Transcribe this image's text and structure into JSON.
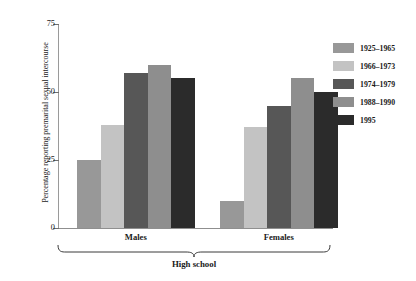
{
  "chart_data": {
    "type": "bar",
    "title": "",
    "xlabel": "High school",
    "ylabel": "Percentage reporting premarital sexual intercourse",
    "categories": [
      "Males",
      "Females"
    ],
    "series": [
      {
        "name": "1925–1965",
        "color": "#989898",
        "values": [
          25,
          10
        ]
      },
      {
        "name": "1966–1973",
        "color": "#c3c3c3",
        "values": [
          38,
          37
        ]
      },
      {
        "name": "1974–1979",
        "color": "#575757",
        "values": [
          57,
          45
        ]
      },
      {
        "name": "1988–1990",
        "color": "#8e8e8e",
        "values": [
          60,
          55
        ]
      },
      {
        "name": "1995",
        "color": "#2b2b2b",
        "values": [
          55,
          50
        ]
      }
    ],
    "ylim": [
      0,
      75
    ],
    "yticks": [
      0,
      25,
      50,
      75
    ],
    "ytick_labels": [
      "0",
      "25",
      "50",
      "75"
    ],
    "grid": false,
    "legend_position": "right",
    "group_bracket_label": "High school"
  },
  "axis": {
    "y_title": "Percentage reporting premarital sexual intercourse",
    "tick_0": "0",
    "tick_25": "25",
    "tick_50": "50",
    "tick_75": "75"
  },
  "groups": {
    "males": "Males",
    "females": "Females",
    "bracket": "High school"
  },
  "legend": {
    "item_0": "1925–1965",
    "item_1": "1966–1973",
    "item_2": "1974–1979",
    "item_3": "1988–1990",
    "item_4": "1995"
  }
}
